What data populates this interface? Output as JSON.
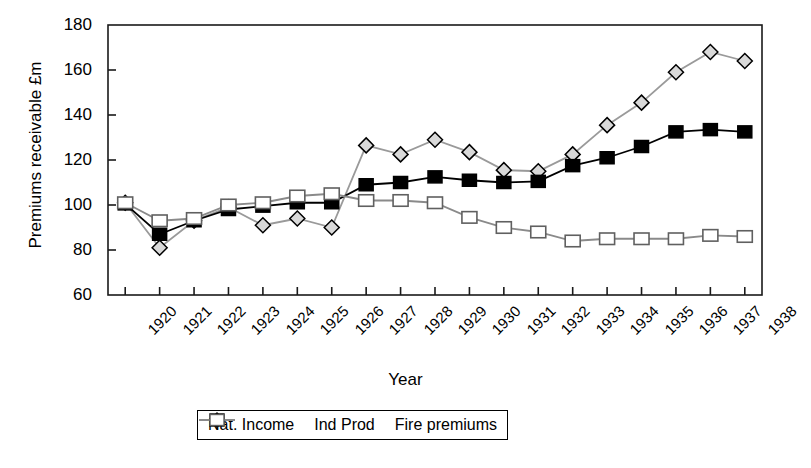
{
  "chart_data": {
    "type": "line",
    "title": "",
    "xlabel": "Year",
    "ylabel": "Premiums receivable £m",
    "ylim": [
      60,
      180
    ],
    "ytick_step": 20,
    "yticks": [
      60,
      80,
      100,
      120,
      140,
      160,
      180
    ],
    "grid": false,
    "legend_position": "bottom-center",
    "categories": [
      "1920",
      "1921",
      "1922",
      "1923",
      "1924",
      "1925",
      "1926",
      "1927",
      "1928",
      "1929",
      "1930",
      "1931",
      "1932",
      "1933",
      "1934",
      "1935",
      "1936",
      "1937",
      "1938"
    ],
    "series": [
      {
        "name": "Nat. Income",
        "marker": "diamond-open",
        "color": "#9a9a9a",
        "marker_fill": "#d9d9d9",
        "marker_stroke": "#000000",
        "values": [
          101,
          81,
          93,
          99,
          91,
          94,
          90,
          126.5,
          122.5,
          129,
          123.5,
          115.5,
          115,
          122.5,
          135.5,
          145.5,
          159,
          168,
          164
        ]
      },
      {
        "name": "Ind Prod",
        "marker": "square-filled",
        "color": "#000000",
        "marker_fill": "#000000",
        "marker_stroke": "#000000",
        "values": [
          100.5,
          87,
          93,
          98,
          99.5,
          101,
          101,
          109,
          110,
          112.5,
          111,
          110,
          110.5,
          117.5,
          121,
          126,
          132.5,
          133.5,
          132.5
        ]
      },
      {
        "name": "Fire premiums",
        "marker": "square-open",
        "color": "#8a8a8a",
        "marker_fill": "#ffffff",
        "marker_stroke": "#606060",
        "values": [
          101,
          93,
          94,
          100,
          101,
          104,
          105,
          102,
          102,
          101,
          94.5,
          90,
          88,
          84,
          85,
          85,
          85,
          86.5,
          86
        ]
      }
    ]
  },
  "axis": {
    "y_title": "Premiums receivable £m",
    "x_title": "Year",
    "y_ticks": [
      "180",
      "160",
      "140",
      "120",
      "100",
      "80",
      "60"
    ],
    "x_ticks": [
      "1920",
      "1921",
      "1922",
      "1923",
      "1924",
      "1925",
      "1926",
      "1927",
      "1928",
      "1929",
      "1930",
      "1931",
      "1932",
      "1933",
      "1934",
      "1935",
      "1936",
      "1937",
      "1938"
    ]
  },
  "legend": {
    "items": [
      {
        "label": "Nat. Income",
        "key": "diamond-open-marker"
      },
      {
        "label": "Ind Prod",
        "key": "square-filled-marker"
      },
      {
        "label": "Fire premiums",
        "key": "square-open-marker"
      }
    ]
  }
}
